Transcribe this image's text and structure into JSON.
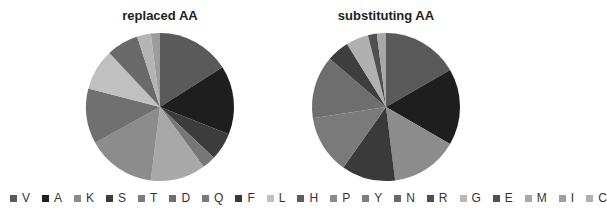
{
  "chart_data": [
    {
      "type": "pie",
      "title": "replaced AA",
      "categories": [
        "V",
        "A",
        "K",
        "S",
        "T",
        "D",
        "Q",
        "F",
        "L",
        "H",
        "P",
        "Y",
        "N",
        "R",
        "G",
        "E",
        "M",
        "I",
        "C"
      ],
      "values": [
        16,
        15,
        3,
        6,
        12,
        15,
        12,
        0,
        9,
        7,
        0,
        0,
        0,
        0,
        3,
        0,
        2,
        0,
        0
      ],
      "note": "approximate slice percentages read clockwise from 12 o'clock"
    },
    {
      "type": "pie",
      "title": "substituting  AA",
      "categories": [
        "V",
        "A",
        "K",
        "S",
        "T",
        "D",
        "Q",
        "F",
        "L",
        "H",
        "P",
        "Y",
        "N",
        "R",
        "G",
        "E",
        "M",
        "I",
        "C"
      ],
      "values": [
        17,
        17,
        0,
        0,
        15,
        0,
        14,
        12,
        0,
        0,
        0,
        13,
        0,
        5,
        5,
        2,
        0,
        0,
        0
      ],
      "note": "approximate slice percentages read clockwise from 12 o'clock"
    }
  ],
  "charts": [
    {
      "title": "replaced AA",
      "slices": [
        {
          "label": "V",
          "pct": 16,
          "color": "#5a5a5a"
        },
        {
          "label": "A",
          "pct": 15,
          "color": "#1e1e1e"
        },
        {
          "label": "S",
          "pct": 6,
          "color": "#3c3c3c"
        },
        {
          "label": "K",
          "pct": 3,
          "color": "#777777"
        },
        {
          "label": "T",
          "pct": 12,
          "color": "#a8a8a8"
        },
        {
          "label": "D",
          "pct": 15,
          "color": "#8c8c8c"
        },
        {
          "label": "Q",
          "pct": 12,
          "color": "#707070"
        },
        {
          "label": "L",
          "pct": 9,
          "color": "#c0c0c0"
        },
        {
          "label": "H",
          "pct": 7,
          "color": "#6a6a6a"
        },
        {
          "label": "G",
          "pct": 3,
          "color": "#b4b4b4"
        },
        {
          "label": "M",
          "pct": 2,
          "color": "#9c9c9c"
        }
      ]
    },
    {
      "title": "substituting  AA",
      "slices": [
        {
          "label": "V",
          "pct": 17,
          "color": "#5a5a5a"
        },
        {
          "label": "A",
          "pct": 17,
          "color": "#1e1e1e"
        },
        {
          "label": "T",
          "pct": 15,
          "color": "#8c8c8c"
        },
        {
          "label": "F",
          "pct": 12,
          "color": "#3a3a3a"
        },
        {
          "label": "Q",
          "pct": 13,
          "color": "#7a7a7a"
        },
        {
          "label": "Y",
          "pct": 14,
          "color": "#6e6e6e"
        },
        {
          "label": "R",
          "pct": 5,
          "color": "#3e3e3e"
        },
        {
          "label": "G",
          "pct": 5,
          "color": "#b0b0b0"
        },
        {
          "label": "E",
          "pct": 2,
          "color": "#505050"
        },
        {
          "label": "M",
          "pct": 2,
          "color": "#a8a8a8"
        },
        {
          "label": "C",
          "pct": 0,
          "color": "#bcbcbc"
        }
      ]
    }
  ],
  "legend": [
    {
      "label": "V",
      "color": "#5a5a5a"
    },
    {
      "label": "A",
      "color": "#1e1e1e"
    },
    {
      "label": "K",
      "color": "#8a8a8a"
    },
    {
      "label": "S",
      "color": "#3c3c3c"
    },
    {
      "label": "T",
      "color": "#7c7c7c"
    },
    {
      "label": "D",
      "color": "#6e6e6e"
    },
    {
      "label": "Q",
      "color": "#7a7a7a"
    },
    {
      "label": "F",
      "color": "#3a3a3a"
    },
    {
      "label": "L",
      "color": "#c0c0c0"
    },
    {
      "label": "H",
      "color": "#5e5e5e"
    },
    {
      "label": "P",
      "color": "#8c8c8c"
    },
    {
      "label": "Y",
      "color": "#7e7e7e"
    },
    {
      "label": "N",
      "color": "#6a6a6a"
    },
    {
      "label": "R",
      "color": "#4e4e4e"
    },
    {
      "label": "G",
      "color": "#b8b8b8"
    },
    {
      "label": "E",
      "color": "#505050"
    },
    {
      "label": "M",
      "color": "#a8a8a8"
    },
    {
      "label": "I",
      "color": "#a0a0a0"
    },
    {
      "label": "C",
      "color": "#b0b0b0"
    }
  ]
}
